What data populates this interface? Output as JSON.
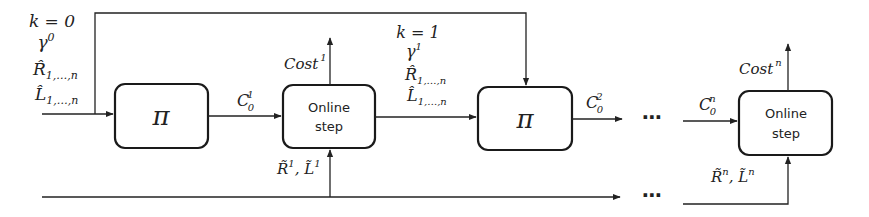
{
  "diagram": {
    "type": "flow",
    "colors": {
      "stroke": "#222222",
      "background": "#ffffff"
    },
    "init_labels": {
      "k": "k = 0",
      "gamma": "γ",
      "gamma_sup": "0",
      "R": "R̂",
      "R_sub": "1,…,n",
      "L": "L̂",
      "L_sub": "1,…,n"
    },
    "mid_labels": {
      "k": "k = 1",
      "gamma": "γ",
      "gamma_sup": "1",
      "R": "R̂",
      "R_sub": "1,…,n",
      "L": "L̂",
      "L_sub": "1,…,n"
    },
    "nodes": [
      {
        "id": "pi-1",
        "label": "π"
      },
      {
        "id": "online-step-1",
        "label_line1": "Online",
        "label_line2": "step"
      },
      {
        "id": "pi-2",
        "label": "π"
      },
      {
        "id": "online-step-n",
        "label_line1": "Online",
        "label_line2": "step"
      }
    ],
    "edges": {
      "c01": {
        "base": "C",
        "sub": "0",
        "sup": "1"
      },
      "c02": {
        "base": "C",
        "sub": "0",
        "sup": "2"
      },
      "c0n": {
        "base": "C",
        "sub": "0",
        "sup": "n"
      },
      "cost1": {
        "base": "Cost",
        "sup": "1"
      },
      "costn": {
        "base": "Cost",
        "sup": "n"
      },
      "rl1": {
        "R": "R̃",
        "R_sup": "1",
        "sep": ", ",
        "L": "L̃",
        "L_sup": "1"
      },
      "rln": {
        "R": "R̃",
        "R_sup": "n",
        "sep": ", ",
        "L": "L̃",
        "L_sup": "n"
      }
    },
    "ellipsis": "⋯"
  }
}
